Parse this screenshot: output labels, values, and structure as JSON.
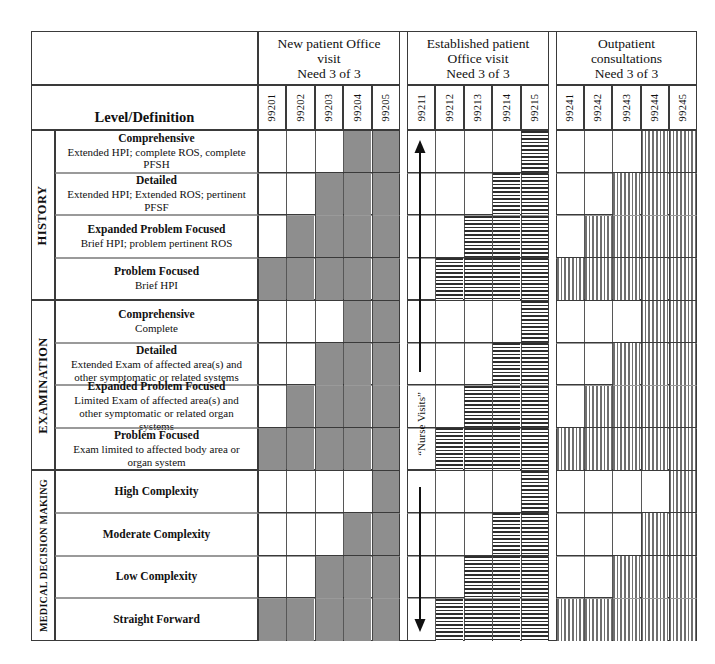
{
  "table": {
    "level_definition_header": "Level/Definition",
    "column_groups": [
      {
        "id": "new-patient",
        "title_lines": [
          "New patient Office",
          "visit",
          "Need 3 of 3"
        ],
        "codes": [
          "99201",
          "99202",
          "99203",
          "99204",
          "99205"
        ],
        "fill": "solid"
      },
      {
        "id": "established-patient",
        "title_lines": [
          "Established patient",
          "Office visit",
          "Need 3 of 3"
        ],
        "codes": [
          "99211",
          "99212",
          "99213",
          "99214",
          "99215"
        ],
        "fill": "hlines"
      },
      {
        "id": "outpatient-consultations",
        "title_lines": [
          "Outpatient",
          "consultations",
          "Need 3 of 3"
        ],
        "codes": [
          "99241",
          "99242",
          "99243",
          "99244",
          "99245"
        ],
        "fill": "vlines"
      }
    ],
    "sections": [
      {
        "id": "history",
        "label": "HISTORY",
        "rows": [
          {
            "title": "Comprehensive",
            "sub": "Extended HPI; complete ROS, complete PFSH",
            "new_patient": [
              0,
              0,
              0,
              1,
              1
            ],
            "established_patient": [
              0,
              0,
              0,
              0,
              1
            ],
            "outpatient": [
              0,
              0,
              0,
              1,
              1
            ]
          },
          {
            "title": "Detailed",
            "sub": "Extended HPI;  Extended ROS; pertinent PFSF",
            "new_patient": [
              0,
              0,
              1,
              1,
              1
            ],
            "established_patient": [
              0,
              0,
              0,
              1,
              1
            ],
            "outpatient": [
              0,
              0,
              1,
              1,
              1
            ]
          },
          {
            "title": "Expanded Problem Focused",
            "sub": "Brief HPI; problem pertinent ROS",
            "new_patient": [
              0,
              1,
              1,
              1,
              1
            ],
            "established_patient": [
              0,
              0,
              1,
              1,
              1
            ],
            "outpatient": [
              0,
              1,
              1,
              1,
              1
            ]
          },
          {
            "title": "Problem Focused",
            "sub": "Brief HPI",
            "new_patient": [
              1,
              1,
              1,
              1,
              1
            ],
            "established_patient": [
              0,
              1,
              1,
              1,
              1
            ],
            "outpatient": [
              1,
              1,
              1,
              1,
              1
            ]
          }
        ]
      },
      {
        "id": "examination",
        "label": "EXAMINATION",
        "rows": [
          {
            "title": "Comprehensive",
            "sub": "Complete",
            "new_patient": [
              0,
              0,
              0,
              1,
              1
            ],
            "established_patient": [
              0,
              0,
              0,
              0,
              1
            ],
            "outpatient": [
              0,
              0,
              0,
              1,
              1
            ]
          },
          {
            "title": "Detailed",
            "sub": "Extended Exam of affected area(s) and other symptomatic or related systems",
            "new_patient": [
              0,
              0,
              1,
              1,
              1
            ],
            "established_patient": [
              0,
              0,
              0,
              1,
              1
            ],
            "outpatient": [
              0,
              0,
              1,
              1,
              1
            ]
          },
          {
            "title": "Expanded Problem Focused",
            "sub": "Limited Exam of affected area(s) and other symptomatic or related organ systems",
            "new_patient": [
              0,
              1,
              1,
              1,
              1
            ],
            "established_patient": [
              0,
              0,
              1,
              1,
              1
            ],
            "outpatient": [
              0,
              1,
              1,
              1,
              1
            ]
          },
          {
            "title": "Problem Focused",
            "sub": "Exam limited to  affected body area or organ system",
            "new_patient": [
              1,
              1,
              1,
              1,
              1
            ],
            "established_patient": [
              0,
              1,
              1,
              1,
              1
            ],
            "outpatient": [
              1,
              1,
              1,
              1,
              1
            ]
          }
        ]
      },
      {
        "id": "medical-decision-making",
        "label": "MEDICAL DECISION MAKING",
        "rows": [
          {
            "title": "High Complexity",
            "sub": "",
            "new_patient": [
              0,
              0,
              0,
              0,
              1
            ],
            "established_patient": [
              0,
              0,
              0,
              0,
              1
            ],
            "outpatient": [
              0,
              0,
              0,
              0,
              1
            ]
          },
          {
            "title": "Moderate Complexity",
            "sub": "",
            "new_patient": [
              0,
              0,
              0,
              1,
              1
            ],
            "established_patient": [
              0,
              0,
              0,
              1,
              1
            ],
            "outpatient": [
              0,
              0,
              0,
              1,
              1
            ]
          },
          {
            "title": "Low Complexity",
            "sub": "",
            "new_patient": [
              0,
              0,
              1,
              1,
              1
            ],
            "established_patient": [
              0,
              0,
              1,
              1,
              1
            ],
            "outpatient": [
              0,
              0,
              1,
              1,
              1
            ]
          },
          {
            "title": "Straight Forward",
            "sub": "",
            "new_patient": [
              1,
              1,
              1,
              1,
              1
            ],
            "established_patient": [
              0,
              1,
              1,
              1,
              1
            ],
            "outpatient": [
              1,
              1,
              1,
              1,
              1
            ]
          }
        ]
      }
    ],
    "annotations": {
      "nurse_visits_label": "“Nurse Visits”",
      "arrow_up_name": "arrow-up-icon",
      "arrow_down_name": "arrow-down-icon"
    }
  },
  "colors": {
    "solid_fill": "#8e8e8e",
    "hatch_line": "#2e2e2e",
    "vhatch_line": "#6f6f6f",
    "border": "#3a3a3a",
    "page_bg": "#ffffff"
  }
}
